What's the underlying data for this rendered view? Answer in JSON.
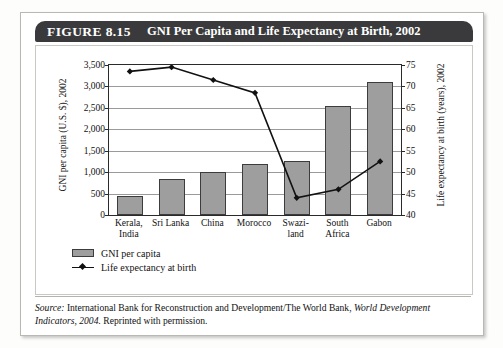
{
  "figure": {
    "number": "FIGURE 8.15",
    "title": "GNI Per Capita and Life Expectancy at Birth, 2002"
  },
  "legend": {
    "bar_label": "GNI per capita",
    "line_label": "Life expectancy at birth"
  },
  "source": {
    "prefix": "Source:",
    "text_1": " International Bank for Reconstruction and Development/The World Bank, ",
    "italic_1": "World Development Indicators, 2004.",
    "text_2": " Reprinted with permission."
  },
  "chart_data": {
    "type": "bar",
    "title": "GNI Per Capita and Life Expectancy at Birth, 2002",
    "categories": [
      "Kerala, India",
      "Sri Lanka",
      "China",
      "Morocco",
      "Swaziland",
      "South Africa",
      "Gabon"
    ],
    "category_lines": [
      [
        "Kerala,",
        "India"
      ],
      [
        "Sri Lanka"
      ],
      [
        "China"
      ],
      [
        "Morocco"
      ],
      [
        "Swazi-",
        "land"
      ],
      [
        "South",
        "Africa"
      ],
      [
        "Gabon"
      ]
    ],
    "series": [
      {
        "name": "GNI per capita",
        "type": "bar",
        "axis": "left",
        "values": [
          450,
          850,
          1000,
          1190,
          1270,
          2550,
          3100
        ],
        "color": "#9e9e9e"
      },
      {
        "name": "Life expectancy at birth",
        "type": "line",
        "axis": "right",
        "values": [
          73.5,
          74.5,
          71.5,
          68.5,
          44.0,
          46.0,
          52.5
        ],
        "color": "#111111"
      }
    ],
    "ylabel": "GNI per capita (U.S. $), 2002",
    "ylabel_right": "Life expectancy at birth (years), 2002",
    "xlabel": "",
    "ylim": [
      0,
      3500
    ],
    "ylim_right": [
      40,
      75
    ],
    "yticks": [
      "0",
      "500",
      "1,000",
      "1,500",
      "2,000",
      "2,500",
      "3,000",
      "3,500"
    ],
    "ytick_values": [
      0,
      500,
      1000,
      1500,
      2000,
      2500,
      3000,
      3500
    ],
    "yticks_right": [
      "40",
      "45",
      "50",
      "55",
      "60",
      "65",
      "70",
      "75"
    ],
    "ytick_values_right": [
      40,
      45,
      50,
      55,
      60,
      65,
      70,
      75
    ],
    "grid": true,
    "legend_position": "below-left"
  }
}
